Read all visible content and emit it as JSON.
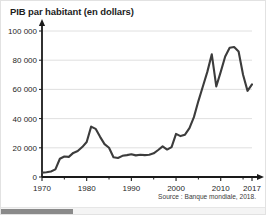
{
  "figure": {
    "title": "PIB par habitant (en dollars)",
    "source_note": "Source : Banque mondiale, 2018.",
    "line_color": "#3c3c3c",
    "axis_color": "#1a1a1a",
    "grid_color": "#d8d8d8",
    "border_color": "#e2e2e2"
  },
  "scrollbar": {
    "thumb_label": "horizontal-scroll-thumb"
  },
  "chart_data": {
    "type": "line",
    "title": "PIB par habitant (en dollars)",
    "xlabel": "",
    "ylabel": "",
    "grid": true,
    "legend": "none",
    "xlim": [
      1970,
      2017
    ],
    "ylim": [
      0,
      100000
    ],
    "ytick_labels": [
      "0",
      "20 000",
      "40 000",
      "60 000",
      "80 000",
      "100 000"
    ],
    "ytick_values": [
      0,
      20000,
      40000,
      60000,
      80000,
      100000
    ],
    "xtick_labels": [
      "1970",
      "1980",
      "1990",
      "2000",
      "2010",
      "2017"
    ],
    "xtick_values": [
      1970,
      1980,
      1990,
      2000,
      2010,
      2017
    ],
    "xminor_ticks": [
      1975,
      1985,
      1995,
      2005,
      2015
    ],
    "series": [
      {
        "name": "PIB par habitant",
        "x": [
          1970,
          1971,
          1972,
          1973,
          1974,
          1975,
          1976,
          1977,
          1978,
          1979,
          1980,
          1981,
          1982,
          1983,
          1984,
          1985,
          1986,
          1987,
          1988,
          1989,
          1990,
          1991,
          1992,
          1993,
          1994,
          1995,
          1996,
          1997,
          1998,
          1999,
          2000,
          2001,
          2002,
          2003,
          2004,
          2005,
          2006,
          2007,
          2008,
          2009,
          2010,
          2011,
          2012,
          2013,
          2014,
          2015,
          2016,
          2017
        ],
        "values": [
          3000,
          3300,
          3800,
          5200,
          12500,
          14000,
          13800,
          16500,
          17800,
          20500,
          24000,
          34500,
          33000,
          27500,
          22500,
          20000,
          13500,
          13000,
          14500,
          15000,
          15600,
          14800,
          15200,
          15000,
          15200,
          16200,
          18500,
          21000,
          18800,
          20500,
          29500,
          28000,
          29000,
          33500,
          41000,
          52000,
          62000,
          72000,
          84000,
          62000,
          72000,
          82500,
          88500,
          89000,
          86000,
          70000,
          59000,
          63500
        ]
      }
    ],
    "annotations": []
  }
}
